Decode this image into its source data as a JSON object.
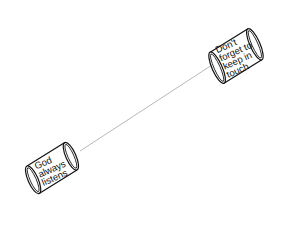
{
  "illustration": {
    "subject": "tin can telephone",
    "colors": {
      "background": "#ffffff",
      "ink": "#111111",
      "string": "#9a9a9a"
    },
    "can_top_right": {
      "lines": [
        "Don't",
        "forget to",
        "keep in",
        "touch"
      ]
    },
    "can_bottom_left": {
      "lines": [
        "God",
        "always",
        "listens"
      ]
    }
  }
}
